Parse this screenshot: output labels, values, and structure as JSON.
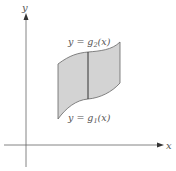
{
  "figure": {
    "axes": {
      "x_label": "x",
      "y_label": "y"
    },
    "region": {
      "fill_color": "#d3d3d3",
      "edge_color": "#555555",
      "upper_curve_label": {
        "prefix": "y = g",
        "subscript": "2",
        "suffix": "(x)"
      },
      "lower_curve_label": {
        "prefix": "y = g",
        "subscript": "1",
        "suffix": "(x)"
      }
    },
    "colors": {
      "axis": "#555555",
      "text": "#555555",
      "background": "#ffffff"
    }
  }
}
